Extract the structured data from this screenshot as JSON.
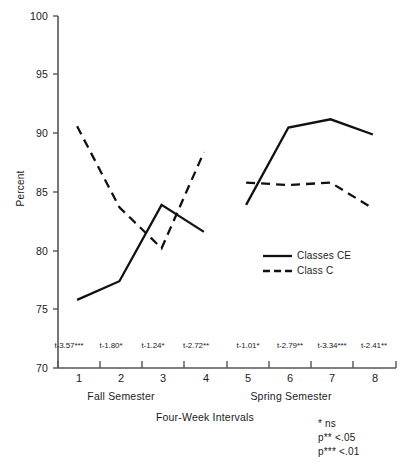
{
  "chart_data": {
    "type": "line",
    "title": "",
    "xlabel": "Four-Week Intervals",
    "ylabel": "Percent",
    "ylim": [
      70,
      100
    ],
    "ytick_labels": [
      "100",
      "95",
      "90",
      "85",
      "80",
      "75",
      "70"
    ],
    "ytick_values": [
      100,
      95,
      90,
      85,
      80,
      75,
      70
    ],
    "categories": [
      "1",
      "2",
      "3",
      "4",
      "5",
      "6",
      "7",
      "8"
    ],
    "grid": false,
    "legend_position": "inside-right",
    "series": [
      {
        "name": "Classes CE",
        "style": "solid",
        "values": [
          75.8,
          77.4,
          83.9,
          81.6,
          83.9,
          90.5,
          91.2,
          89.9
        ]
      },
      {
        "name": "Class C",
        "style": "dashed",
        "values": [
          90.6,
          83.7,
          80.2,
          88.4,
          85.8,
          85.6,
          85.8,
          83.6
        ]
      }
    ],
    "group_labels": [
      {
        "label": "Fall Semester",
        "categories": [
          "1",
          "2",
          "3",
          "4"
        ]
      },
      {
        "label": "Spring Semester",
        "categories": [
          "5",
          "6",
          "7",
          "8"
        ]
      }
    ],
    "annotations": [
      "t-3.57***",
      "t-1.80*",
      "t-1.24*",
      "t-2.72**",
      "t-1.01*",
      "t-2.79**",
      "t-3.34***",
      "t-2.41**"
    ],
    "footnotes": [
      "*  ns",
      "p** <.05",
      "p*** <.01"
    ],
    "colors": {
      "line": "#111111",
      "axis": "#555555",
      "text": "#1a1a1a"
    }
  }
}
